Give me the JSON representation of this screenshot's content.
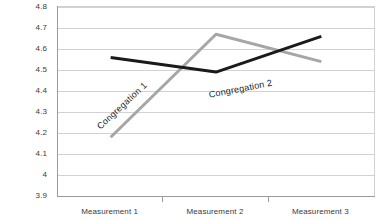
{
  "chart_data": {
    "type": "line",
    "title": "",
    "xlabel": "",
    "ylabel": "",
    "categories": [
      "Measurement 1",
      "Measurement 2",
      "Measurement 3"
    ],
    "ylim": [
      3.9,
      4.8
    ],
    "ytick_step": 0.1,
    "yticks": [
      "4.8",
      "4.7",
      "4.6",
      "4.5",
      "4.4",
      "4.3",
      "4.2",
      "4.1",
      "4",
      "3.9"
    ],
    "ytick_values": [
      4.8,
      4.7,
      4.6,
      4.5,
      4.4,
      4.3,
      4.2,
      4.1,
      4.0,
      3.9
    ],
    "grid": true,
    "grid_axis": "y",
    "legend": "inline-labels",
    "series": [
      {
        "name": "Congregation 1",
        "values": [
          4.18,
          4.67,
          4.54
        ],
        "color": "#a6a6a6",
        "width": 3
      },
      {
        "name": "Congregation 2",
        "values": [
          4.56,
          4.49,
          4.66
        ],
        "color": "#1a1a1a",
        "width": 3
      }
    ],
    "annotations": [
      {
        "text": "Congregation 1",
        "series": 0,
        "rotation": -43
      },
      {
        "text": "Congregation 2",
        "series": 1,
        "rotation": -11
      }
    ]
  },
  "axis_colors": {
    "gridline": "#d2d2d2",
    "axis": "#9b9b9b",
    "tick_text": "#3a3a3a"
  }
}
